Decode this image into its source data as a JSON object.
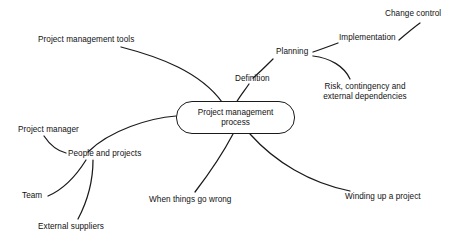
{
  "diagram": {
    "type": "mind-map",
    "background_color": "#ffffff",
    "stroke_color": "#1a1a1a",
    "text_color": "#111111",
    "center": {
      "label_line1": "Project management",
      "label_line2": "process"
    },
    "branches": [
      {
        "id": "project-management-tools",
        "label": "Project management tools"
      },
      {
        "id": "definition",
        "label": "Definition"
      },
      {
        "id": "planning",
        "label": "Planning"
      },
      {
        "id": "implementation",
        "label": "Implementation"
      },
      {
        "id": "change-control",
        "label": "Change control"
      },
      {
        "id": "risk-contingency",
        "label_line1": "Risk, contingency and",
        "label_line2": "external dependencies"
      },
      {
        "id": "winding-up-a-project",
        "label": "Winding up a project"
      },
      {
        "id": "when-things-go-wrong",
        "label": "When things go wrong"
      },
      {
        "id": "people-and-projects",
        "label": "People and projects"
      },
      {
        "id": "project-manager",
        "label": "Project manager"
      },
      {
        "id": "team",
        "label": "Team"
      },
      {
        "id": "external-suppliers",
        "label": "External suppliers"
      }
    ]
  }
}
